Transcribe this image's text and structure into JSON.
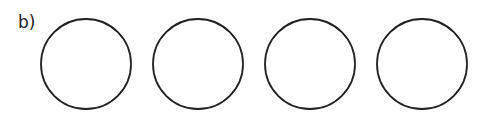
{
  "label": "b)",
  "circles": [
    {
      "cx": 86,
      "cy": 64,
      "r": 45
    },
    {
      "cx": 198,
      "cy": 64,
      "r": 45
    },
    {
      "cx": 310,
      "cy": 64,
      "r": 45
    },
    {
      "cx": 422,
      "cy": 64,
      "r": 45
    }
  ],
  "stroke_color": "#222222"
}
